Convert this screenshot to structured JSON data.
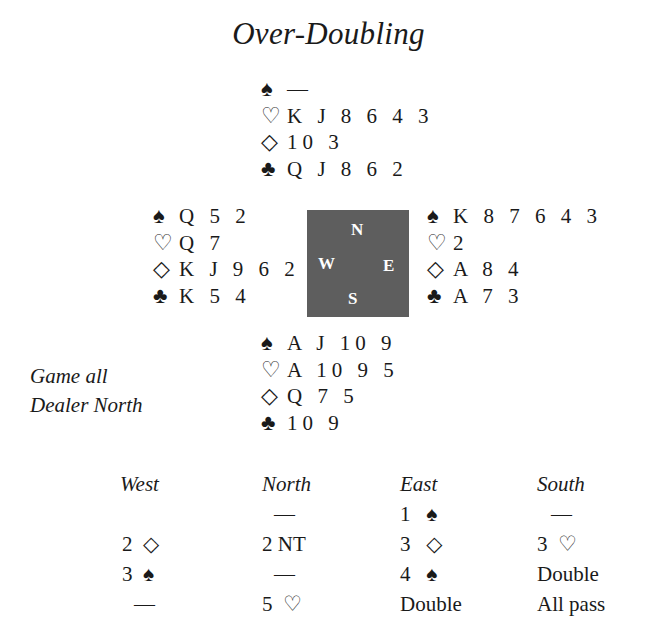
{
  "title": "Over-Doubling",
  "suits": {
    "spade": "♠",
    "heart": "♡",
    "diamond": "◇",
    "club": "♣"
  },
  "hands": {
    "north": {
      "spades": "—",
      "hearts": "K J 8 6 4 3",
      "diamonds": "10 3",
      "clubs": "Q J 8 6 2"
    },
    "west": {
      "spades": "Q 5 2",
      "hearts": "Q 7",
      "diamonds": "K J 9 6 2",
      "clubs": "K 5 4"
    },
    "east": {
      "spades": "K 8 7 6 4 3",
      "hearts": "2",
      "diamonds": "A 8 4",
      "clubs": "A 7 3"
    },
    "south": {
      "spades": "A J 10 9",
      "hearts": "A 10 9 5",
      "diamonds": "Q 7 5",
      "clubs": "10 9"
    }
  },
  "compass": {
    "n": "N",
    "w": "W",
    "e": "E",
    "s": "S",
    "color": "#5e5e5e"
  },
  "conditions": {
    "vulnerability": "Game all",
    "dealer": "Dealer North"
  },
  "auction": {
    "headers": {
      "west": "West",
      "north": "North",
      "east": "East",
      "south": "South"
    },
    "west": [
      {
        "text": ""
      },
      {
        "level": "2",
        "suit": "◇"
      },
      {
        "level": "3",
        "suit": "♠"
      },
      {
        "text": "—"
      }
    ],
    "north": [
      {
        "text": "—"
      },
      {
        "text": "2 NT"
      },
      {
        "text": "—"
      },
      {
        "level": "5",
        "suit": "♡"
      }
    ],
    "east": [
      {
        "level": "1",
        "suit": "♠"
      },
      {
        "level": "3",
        "suit": "◇"
      },
      {
        "level": "4",
        "suit": "♠"
      },
      {
        "text": "Double"
      }
    ],
    "south": [
      {
        "text": "—"
      },
      {
        "level": "3",
        "suit": "♡"
      },
      {
        "text": "Double"
      },
      {
        "text": "All pass"
      }
    ]
  }
}
